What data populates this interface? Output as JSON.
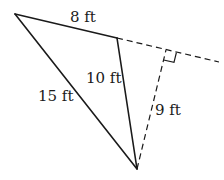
{
  "diagram": {
    "type": "triangle-with-altitude",
    "colors": {
      "stroke": "#1a1a1a",
      "background": "#ffffff"
    },
    "vertices": {
      "A": {
        "x": 15,
        "y": 14
      },
      "B": {
        "x": 117,
        "y": 38
      },
      "C": {
        "x": 137,
        "y": 169
      },
      "H": {
        "x": 166,
        "y": 50
      }
    },
    "extension_end": {
      "x": 219,
      "y": 62
    },
    "labels": {
      "side_ab": "8 ft",
      "side_bc": "10 ft",
      "side_ac": "15 ft",
      "altitude": "9 ft"
    },
    "right_angle_marker": true
  }
}
